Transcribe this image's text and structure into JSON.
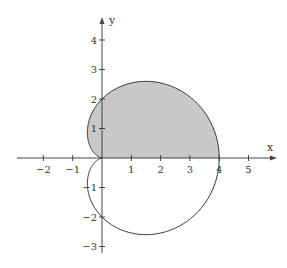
{
  "chart_data": {
    "type": "line",
    "subtype": "polar-curve",
    "title": "",
    "equation": "r = 2 + 2cos(θ)",
    "xlabel": "x",
    "ylabel": "y",
    "xlim": [
      -2.9,
      5.9
    ],
    "ylim": [
      -3.2,
      4.7
    ],
    "grid": false,
    "x_ticks": [
      -2,
      -1,
      1,
      2,
      3,
      4,
      5
    ],
    "x_tick_labels": [
      "−2",
      "−1",
      "1",
      "2",
      "3",
      "4",
      "5"
    ],
    "y_ticks": [
      4,
      3,
      2,
      1,
      -1,
      -2,
      -3
    ],
    "y_tick_labels": [
      "4",
      "3",
      "2",
      "1",
      "−1",
      "−2",
      "−3"
    ],
    "series": [
      {
        "name": "cardioid",
        "r_a": 2,
        "r_b": 2,
        "theta_range": [
          0,
          6.2832
        ],
        "stroke": "#333333",
        "key_points": [
          {
            "x": 4,
            "y": 0
          },
          {
            "x": 1.5,
            "y": 2.598
          },
          {
            "x": 0,
            "y": 2
          },
          {
            "x": -0.5,
            "y": 0.866
          },
          {
            "x": 0,
            "y": 0
          },
          {
            "x": -0.5,
            "y": -0.866
          },
          {
            "x": 0,
            "y": -2
          },
          {
            "x": 1.5,
            "y": -2.598
          }
        ]
      }
    ],
    "shaded_region": {
      "description": "Upper half of cardioid, θ from 0 to π",
      "theta_range": [
        0,
        3.1416
      ],
      "fill": "#c8c8c8"
    },
    "colors": {
      "axis": "#444444",
      "curve": "#333333",
      "fill": "#c8c8c8",
      "background": "#ffffff"
    }
  }
}
